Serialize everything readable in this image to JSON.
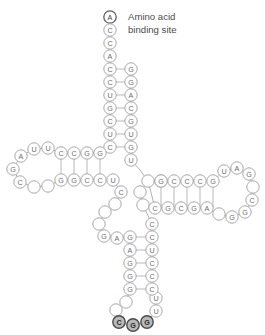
{
  "diagram": {
    "colors": {
      "circle_fill": "#ffffff",
      "circle_stroke": "#a8a8ad",
      "highlight_fill": "#b8b8b8",
      "highlight_stroke": "#4a4a4a",
      "bond_stroke": "#b9b9bd",
      "text": "#6e6e73",
      "label_text": "#4b4b50",
      "background": "#ffffff"
    },
    "annotations": [
      {
        "name": "amino-acid-binding-site-label",
        "line1": "Amino acid",
        "line2": "binding site",
        "x": 128,
        "y": 11
      }
    ],
    "nucleotides": [
      {
        "base": "A",
        "x": 110,
        "y": 17,
        "style": "terminal"
      },
      {
        "base": "C",
        "x": 110,
        "y": 30,
        "style": "normal"
      },
      {
        "base": "C",
        "x": 110,
        "y": 43,
        "style": "normal"
      },
      {
        "base": "A",
        "x": 110,
        "y": 56,
        "style": "normal"
      },
      {
        "base": "C",
        "x": 110,
        "y": 69,
        "style": "normal"
      },
      {
        "base": "C",
        "x": 110,
        "y": 82,
        "style": "normal"
      },
      {
        "base": "U",
        "x": 110,
        "y": 95,
        "style": "normal"
      },
      {
        "base": "G",
        "x": 110,
        "y": 108,
        "style": "normal"
      },
      {
        "base": "C",
        "x": 110,
        "y": 121,
        "style": "normal"
      },
      {
        "base": "U",
        "x": 110,
        "y": 134,
        "style": "normal"
      },
      {
        "base": "C",
        "x": 110,
        "y": 147,
        "style": "normal"
      },
      {
        "base": "G",
        "x": 131,
        "y": 69,
        "style": "normal"
      },
      {
        "base": "G",
        "x": 131,
        "y": 82,
        "style": "normal"
      },
      {
        "base": "A",
        "x": 131,
        "y": 95,
        "style": "normal"
      },
      {
        "base": "C",
        "x": 131,
        "y": 108,
        "style": "normal"
      },
      {
        "base": "G",
        "x": 131,
        "y": 121,
        "style": "normal"
      },
      {
        "base": "U",
        "x": 131,
        "y": 134,
        "style": "normal"
      },
      {
        "base": "G",
        "x": 131,
        "y": 147,
        "style": "normal"
      },
      {
        "base": "U",
        "x": 131,
        "y": 160,
        "style": "normal"
      },
      {
        "base": "A",
        "x": 21,
        "y": 156,
        "style": "normal"
      },
      {
        "base": "U",
        "x": 34,
        "y": 149,
        "style": "normal"
      },
      {
        "base": "U",
        "x": 48,
        "y": 148,
        "style": "normal"
      },
      {
        "base": "C",
        "x": 61,
        "y": 153,
        "style": "normal"
      },
      {
        "base": "C",
        "x": 74,
        "y": 153,
        "style": "normal"
      },
      {
        "base": "G",
        "x": 87,
        "y": 153,
        "style": "normal"
      },
      {
        "base": "G",
        "x": 100,
        "y": 153,
        "style": "normal"
      },
      {
        "base": "G",
        "x": 13,
        "y": 169,
        "style": "normal"
      },
      {
        "base": "C",
        "x": 20,
        "y": 182,
        "style": "normal"
      },
      {
        "base": "",
        "x": 34,
        "y": 187,
        "style": "blank"
      },
      {
        "base": "",
        "x": 48,
        "y": 186,
        "style": "blank"
      },
      {
        "base": "G",
        "x": 61,
        "y": 180,
        "style": "normal"
      },
      {
        "base": "G",
        "x": 74,
        "y": 180,
        "style": "normal"
      },
      {
        "base": "C",
        "x": 87,
        "y": 180,
        "style": "normal"
      },
      {
        "base": "C",
        "x": 100,
        "y": 180,
        "style": "normal"
      },
      {
        "base": "U",
        "x": 113,
        "y": 180,
        "style": "normal"
      },
      {
        "base": "C",
        "x": 121,
        "y": 192,
        "style": "normal"
      },
      {
        "base": "",
        "x": 115,
        "y": 204,
        "style": "blank"
      },
      {
        "base": "",
        "x": 105,
        "y": 212,
        "style": "blank"
      },
      {
        "base": "",
        "x": 99,
        "y": 224,
        "style": "blank"
      },
      {
        "base": "G",
        "x": 104,
        "y": 236,
        "style": "normal"
      },
      {
        "base": "A",
        "x": 117,
        "y": 238,
        "style": "normal"
      },
      {
        "base": "G",
        "x": 130,
        "y": 237,
        "style": "normal"
      },
      {
        "base": "A",
        "x": 130,
        "y": 250,
        "style": "normal"
      },
      {
        "base": "G",
        "x": 130,
        "y": 263,
        "style": "normal"
      },
      {
        "base": "G",
        "x": 130,
        "y": 276,
        "style": "normal"
      },
      {
        "base": "G",
        "x": 130,
        "y": 289,
        "style": "normal"
      },
      {
        "base": "",
        "x": 126,
        "y": 302,
        "style": "blank"
      },
      {
        "base": "",
        "x": 116,
        "y": 310,
        "style": "blank"
      },
      {
        "base": "C",
        "x": 119,
        "y": 322,
        "style": "highlight"
      },
      {
        "base": "G",
        "x": 133,
        "y": 325,
        "style": "highlight"
      },
      {
        "base": "G",
        "x": 147,
        "y": 322,
        "style": "highlight"
      },
      {
        "base": "U",
        "x": 156,
        "y": 311,
        "style": "normal"
      },
      {
        "base": "U",
        "x": 156,
        "y": 298,
        "style": "normal"
      },
      {
        "base": "C",
        "x": 152,
        "y": 289,
        "style": "normal"
      },
      {
        "base": "C",
        "x": 152,
        "y": 276,
        "style": "normal"
      },
      {
        "base": "C",
        "x": 152,
        "y": 263,
        "style": "normal"
      },
      {
        "base": "U",
        "x": 152,
        "y": 250,
        "style": "normal"
      },
      {
        "base": "C",
        "x": 152,
        "y": 237,
        "style": "normal"
      },
      {
        "base": "C",
        "x": 152,
        "y": 224,
        "style": "normal"
      },
      {
        "base": "",
        "x": 143,
        "y": 205,
        "style": "blank"
      },
      {
        "base": "",
        "x": 140,
        "y": 192,
        "style": "blank"
      },
      {
        "base": "",
        "x": 148,
        "y": 181,
        "style": "blank"
      },
      {
        "base": "",
        "x": 161,
        "y": 181,
        "style": "blank"
      },
      {
        "base": "G",
        "x": 161,
        "y": 181,
        "style": "normal"
      },
      {
        "base": "C",
        "x": 174,
        "y": 181,
        "style": "normal"
      },
      {
        "base": "C",
        "x": 187,
        "y": 181,
        "style": "normal"
      },
      {
        "base": "C",
        "x": 200,
        "y": 181,
        "style": "normal"
      },
      {
        "base": "G",
        "x": 213,
        "y": 181,
        "style": "normal"
      },
      {
        "base": "U",
        "x": 224,
        "y": 171,
        "style": "normal"
      },
      {
        "base": "A",
        "x": 237,
        "y": 168,
        "style": "normal"
      },
      {
        "base": "G",
        "x": 249,
        "y": 174,
        "style": "normal"
      },
      {
        "base": "",
        "x": 253,
        "y": 187,
        "style": "blank"
      },
      {
        "base": "C",
        "x": 252,
        "y": 200,
        "style": "normal"
      },
      {
        "base": "G",
        "x": 245,
        "y": 212,
        "style": "normal"
      },
      {
        "base": "G",
        "x": 232,
        "y": 217,
        "style": "normal"
      },
      {
        "base": "",
        "x": 219,
        "y": 214,
        "style": "blank"
      },
      {
        "base": "A",
        "x": 207,
        "y": 208,
        "style": "normal"
      },
      {
        "base": "G",
        "x": 194,
        "y": 208,
        "style": "normal"
      },
      {
        "base": "C",
        "x": 181,
        "y": 208,
        "style": "normal"
      },
      {
        "base": "G",
        "x": 168,
        "y": 208,
        "style": "normal"
      },
      {
        "base": "C",
        "x": 155,
        "y": 208,
        "style": "normal"
      }
    ],
    "bonds": [
      {
        "x1": 110,
        "y1": 69,
        "x2": 131,
        "y2": 69
      },
      {
        "x1": 110,
        "y1": 82,
        "x2": 131,
        "y2": 82
      },
      {
        "x1": 110,
        "y1": 95,
        "x2": 131,
        "y2": 95
      },
      {
        "x1": 110,
        "y1": 108,
        "x2": 131,
        "y2": 108
      },
      {
        "x1": 110,
        "y1": 121,
        "x2": 131,
        "y2": 121
      },
      {
        "x1": 110,
        "y1": 134,
        "x2": 131,
        "y2": 134
      },
      {
        "x1": 110,
        "y1": 147,
        "x2": 131,
        "y2": 147
      },
      {
        "x1": 61,
        "y1": 153,
        "x2": 61,
        "y2": 180
      },
      {
        "x1": 74,
        "y1": 153,
        "x2": 74,
        "y2": 180
      },
      {
        "x1": 87,
        "y1": 153,
        "x2": 87,
        "y2": 180
      },
      {
        "x1": 100,
        "y1": 153,
        "x2": 100,
        "y2": 180
      },
      {
        "x1": 130,
        "y1": 237,
        "x2": 152,
        "y2": 237
      },
      {
        "x1": 130,
        "y1": 250,
        "x2": 152,
        "y2": 250
      },
      {
        "x1": 130,
        "y1": 263,
        "x2": 152,
        "y2": 263
      },
      {
        "x1": 130,
        "y1": 276,
        "x2": 152,
        "y2": 276
      },
      {
        "x1": 130,
        "y1": 289,
        "x2": 152,
        "y2": 289
      },
      {
        "x1": 161,
        "y1": 181,
        "x2": 161,
        "y2": 208
      },
      {
        "x1": 174,
        "y1": 181,
        "x2": 174,
        "y2": 208
      },
      {
        "x1": 187,
        "y1": 181,
        "x2": 187,
        "y2": 208
      },
      {
        "x1": 200,
        "y1": 181,
        "x2": 200,
        "y2": 208
      },
      {
        "x1": 213,
        "y1": 181,
        "x2": 213,
        "y2": 208
      }
    ],
    "backbone": [
      [
        [
          110,
          17
        ],
        [
          110,
          30
        ],
        [
          110,
          43
        ],
        [
          110,
          56
        ],
        [
          110,
          69
        ],
        [
          110,
          82
        ],
        [
          110,
          95
        ],
        [
          110,
          108
        ],
        [
          110,
          121
        ],
        [
          110,
          134
        ],
        [
          110,
          147
        ],
        [
          100,
          153
        ]
      ],
      [
        [
          100,
          153
        ],
        [
          87,
          153
        ],
        [
          74,
          153
        ],
        [
          61,
          153
        ],
        [
          48,
          148
        ],
        [
          34,
          149
        ],
        [
          21,
          156
        ],
        [
          13,
          169
        ],
        [
          20,
          182
        ],
        [
          34,
          187
        ],
        [
          48,
          186
        ],
        [
          61,
          180
        ],
        [
          74,
          180
        ],
        [
          87,
          180
        ],
        [
          100,
          180
        ],
        [
          113,
          180
        ],
        [
          121,
          192
        ],
        [
          115,
          204
        ],
        [
          105,
          212
        ],
        [
          99,
          224
        ],
        [
          104,
          236
        ],
        [
          117,
          238
        ],
        [
          130,
          237
        ]
      ],
      [
        [
          130,
          237
        ],
        [
          130,
          250
        ],
        [
          130,
          263
        ],
        [
          130,
          276
        ],
        [
          130,
          289
        ],
        [
          126,
          302
        ],
        [
          116,
          310
        ],
        [
          119,
          322
        ],
        [
          133,
          325
        ],
        [
          147,
          322
        ],
        [
          156,
          311
        ],
        [
          156,
          298
        ],
        [
          152,
          289
        ],
        [
          152,
          276
        ],
        [
          152,
          263
        ],
        [
          152,
          250
        ],
        [
          152,
          237
        ],
        [
          152,
          224
        ],
        [
          143,
          205
        ],
        [
          140,
          192
        ],
        [
          148,
          181
        ],
        [
          155,
          208
        ]
      ],
      [
        [
          155,
          208
        ],
        [
          168,
          208
        ],
        [
          181,
          208
        ],
        [
          194,
          208
        ],
        [
          207,
          208
        ],
        [
          219,
          214
        ],
        [
          232,
          217
        ],
        [
          245,
          212
        ],
        [
          252,
          200
        ],
        [
          253,
          187
        ],
        [
          249,
          174
        ],
        [
          237,
          168
        ],
        [
          224,
          171
        ],
        [
          213,
          181
        ],
        [
          200,
          181
        ],
        [
          187,
          181
        ],
        [
          174,
          181
        ],
        [
          161,
          181
        ],
        [
          148,
          181
        ]
      ],
      [
        [
          131,
          160
        ],
        [
          131,
          147
        ],
        [
          131,
          134
        ],
        [
          131,
          121
        ],
        [
          131,
          108
        ],
        [
          131,
          95
        ],
        [
          131,
          82
        ],
        [
          131,
          69
        ]
      ],
      [
        [
          131,
          160
        ],
        [
          140,
          170
        ],
        [
          148,
          181
        ]
      ]
    ]
  }
}
